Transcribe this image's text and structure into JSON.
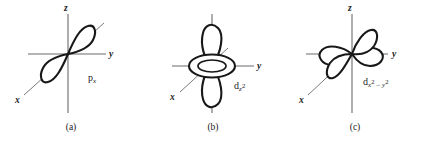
{
  "figure": {
    "background_color": "#ffffff",
    "line_color": "#181818",
    "axis_color": "#6b6b6b",
    "panels": [
      {
        "id": "a",
        "caption": "(a)",
        "orbital_label_plain": "px",
        "orbital_label_base": "p",
        "orbital_label_sub": "x",
        "orbital_type": "p",
        "axes": {
          "z": "z",
          "y": "y",
          "x": "x"
        }
      },
      {
        "id": "b",
        "caption": "(b)",
        "orbital_label_plain": "dz2",
        "orbital_label_base": "d",
        "orbital_label_sub": "z",
        "orbital_label_sup": "2",
        "orbital_type": "d-z2",
        "axes": {
          "z": "",
          "y": "y",
          "x": "x"
        }
      },
      {
        "id": "c",
        "caption": "(c)",
        "orbital_label_plain": "dx2 - y2",
        "orbital_label_base": "d",
        "orbital_label_sub_1": "x",
        "orbital_label_sup_1": "2",
        "orbital_label_minus": " – ",
        "orbital_label_sub_2": "y",
        "orbital_label_sup_2": "2",
        "orbital_type": "d-x2-y2",
        "axes": {
          "z": "z",
          "y": "y",
          "x": "x"
        }
      }
    ]
  }
}
